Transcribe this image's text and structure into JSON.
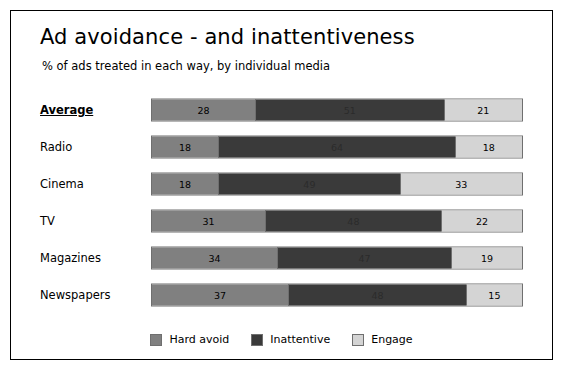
{
  "chart_data": {
    "type": "bar",
    "title": "Ad avoidance - and inattentiveness",
    "subtitle": "% of ads treated in each way, by individual media",
    "xlabel": "",
    "ylabel": "",
    "xlim": [
      0,
      100
    ],
    "orientation": "horizontal",
    "stacked": true,
    "stack_total_percent": 100,
    "grid": false,
    "legend_position": "bottom-center",
    "categories": [
      "Average",
      "Radio",
      "Cinema",
      "TV",
      "Magazines",
      "Newspapers"
    ],
    "series": [
      {
        "name": "Hard avoid",
        "color": "#808080",
        "values": [
          28,
          18,
          18,
          31,
          34,
          37
        ]
      },
      {
        "name": "Inattentive",
        "color": "#3a3a3a",
        "values": [
          51,
          64,
          49,
          48,
          47,
          48
        ]
      },
      {
        "name": "Engage",
        "color": "#d4d4d4",
        "values": [
          21,
          18,
          33,
          22,
          19,
          15
        ]
      }
    ],
    "rows": [
      {
        "label": "Average",
        "emphasis": true,
        "hard_avoid": 28,
        "inattentive": 51,
        "engage": 21
      },
      {
        "label": "Radio",
        "emphasis": false,
        "hard_avoid": 18,
        "inattentive": 64,
        "engage": 18
      },
      {
        "label": "Cinema",
        "emphasis": false,
        "hard_avoid": 18,
        "inattentive": 49,
        "engage": 33
      },
      {
        "label": "TV",
        "emphasis": false,
        "hard_avoid": 31,
        "inattentive": 48,
        "engage": 22
      },
      {
        "label": "Magazines",
        "emphasis": false,
        "hard_avoid": 34,
        "inattentive": 47,
        "engage": 19
      },
      {
        "label": "Newspapers",
        "emphasis": false,
        "hard_avoid": 37,
        "inattentive": 48,
        "engage": 15
      }
    ],
    "legend": [
      {
        "label": "Hard avoid",
        "color": "#808080"
      },
      {
        "label": "Inattentive",
        "color": "#3a3a3a"
      },
      {
        "label": "Engage",
        "color": "#d4d4d4"
      }
    ]
  }
}
